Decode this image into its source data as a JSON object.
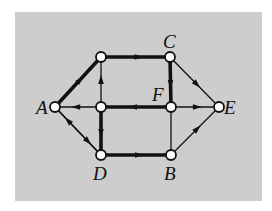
{
  "diagram": {
    "type": "directed-graph",
    "background": "#cdcdcd",
    "edge_color": "#111111",
    "node_fill": "#ffffff",
    "nodes": [
      {
        "id": "A",
        "label": "A",
        "x": 55,
        "y": 107,
        "label_x": 36,
        "label_y": 114
      },
      {
        "id": "P",
        "label": "",
        "x": 101,
        "y": 57
      },
      {
        "id": "C",
        "label": "C",
        "x": 170,
        "y": 57,
        "label_x": 163,
        "label_y": 48
      },
      {
        "id": "Q",
        "label": "",
        "x": 101,
        "y": 107
      },
      {
        "id": "F",
        "label": "F",
        "x": 171,
        "y": 107,
        "label_x": 152,
        "label_y": 101
      },
      {
        "id": "E",
        "label": "E",
        "x": 219,
        "y": 107,
        "label_x": 224,
        "label_y": 114
      },
      {
        "id": "D",
        "label": "D",
        "x": 101,
        "y": 155,
        "label_x": 93,
        "label_y": 180
      },
      {
        "id": "B",
        "label": "B",
        "x": 171,
        "y": 155,
        "label_x": 164,
        "label_y": 180
      }
    ],
    "edges": [
      {
        "from": "A",
        "to": "P",
        "thick": true,
        "arrows": [
          0.55
        ]
      },
      {
        "from": "P",
        "to": "C",
        "thick": true,
        "arrows": [
          0.55
        ]
      },
      {
        "from": "C",
        "to": "F",
        "thick": true,
        "arrows": [
          0.55
        ]
      },
      {
        "from": "C",
        "to": "E",
        "thick": false,
        "arrows": [
          0.55
        ]
      },
      {
        "from": "Q",
        "to": "P",
        "thick": false,
        "arrows": [
          0.55
        ]
      },
      {
        "from": "Q",
        "to": "A",
        "thick": false,
        "arrows": [
          0.55
        ]
      },
      {
        "from": "F",
        "to": "Q",
        "thick": true,
        "arrows": [
          0.55
        ]
      },
      {
        "from": "F",
        "to": "E",
        "thick": false,
        "arrows": [
          0.55
        ]
      },
      {
        "from": "Q",
        "to": "D",
        "thick": true,
        "arrows": [
          0.55
        ]
      },
      {
        "from": "A",
        "to": "D",
        "thick": false,
        "arrows": [
          0.72
        ]
      },
      {
        "from": "D",
        "to": "A",
        "thick": false,
        "arrows": [
          0.72
        ]
      },
      {
        "from": "D",
        "to": "B",
        "thick": true,
        "arrows": [
          0.55
        ]
      },
      {
        "from": "B",
        "to": "E",
        "thick": false,
        "arrows": [
          0.55
        ]
      },
      {
        "from": "F",
        "to": "B",
        "thick": false,
        "arrows": []
      }
    ]
  }
}
